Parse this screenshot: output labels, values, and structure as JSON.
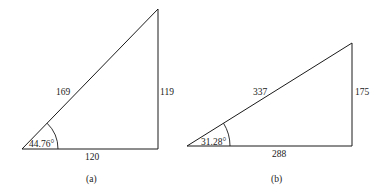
{
  "diagrams": [
    {
      "id": "a",
      "caption": "(a)",
      "hypotenuse": "169",
      "opposite": "119",
      "adjacent": "120",
      "angle": "44.76°",
      "vertices": {
        "left": [
          22,
          149
        ],
        "right": [
          158,
          149
        ],
        "top": [
          158,
          9
        ]
      }
    },
    {
      "id": "b",
      "caption": "(b)",
      "hypotenuse": "337",
      "opposite": "175",
      "adjacent": "288",
      "angle": "31.28°",
      "vertices": {
        "left": [
          187,
          146
        ],
        "right": [
          352,
          146
        ],
        "top": [
          352,
          43
        ]
      }
    }
  ]
}
